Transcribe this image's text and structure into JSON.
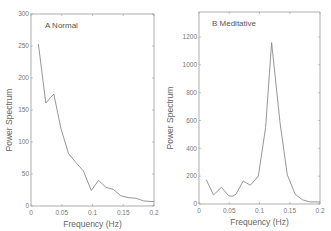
{
  "chart_data": [
    {
      "type": "line",
      "title": "A Normal",
      "xlabel": "Frequency (Hz)",
      "ylabel": "Power Spectrum",
      "xlim": [
        0,
        0.2
      ],
      "ylim": [
        0,
        300
      ],
      "xticks": [
        0,
        0.05,
        0.1,
        0.15,
        0.2
      ],
      "xtick_labels": [
        "0",
        "0.05",
        "0.1",
        "0.15",
        "0.2"
      ],
      "yticks": [
        0,
        50,
        100,
        150,
        200,
        250,
        300
      ],
      "ytick_labels": [
        "0",
        "50",
        "100",
        "150",
        "200",
        "250",
        "300"
      ],
      "grid": false,
      "series": [
        {
          "name": "Normal",
          "x": [
            0.012,
            0.024,
            0.037,
            0.049,
            0.061,
            0.073,
            0.085,
            0.098,
            0.11,
            0.122,
            0.134,
            0.146,
            0.159,
            0.171,
            0.183,
            0.195,
            0.2
          ],
          "y": [
            253,
            161,
            175,
            120,
            82,
            68,
            55,
            24,
            40,
            29,
            26,
            16,
            13,
            12,
            8,
            7,
            7
          ]
        }
      ]
    },
    {
      "type": "line",
      "title": "B Meditative",
      "xlabel": "Frequency (Hz)",
      "ylabel": "Power Spectrum",
      "xlim": [
        0,
        0.2
      ],
      "ylim": [
        0,
        1380
      ],
      "xticks": [
        0,
        0.05,
        0.1,
        0.15,
        0.2
      ],
      "xtick_labels": [
        "0",
        "0.05",
        "0.1",
        "0.15",
        "0.2"
      ],
      "yticks": [
        0,
        200,
        400,
        600,
        800,
        1000,
        1200
      ],
      "ytick_labels": [
        "0",
        "200",
        "400",
        "600",
        "800",
        "1000",
        "1200"
      ],
      "grid": false,
      "series": [
        {
          "name": "Meditative",
          "x": [
            0.012,
            0.024,
            0.037,
            0.049,
            0.055,
            0.061,
            0.073,
            0.085,
            0.098,
            0.11,
            0.12,
            0.134,
            0.146,
            0.159,
            0.171,
            0.183,
            0.195,
            0.2
          ],
          "y": [
            175,
            65,
            120,
            60,
            55,
            70,
            165,
            135,
            200,
            550,
            1160,
            580,
            210,
            70,
            30,
            15,
            15,
            15
          ]
        }
      ]
    }
  ]
}
